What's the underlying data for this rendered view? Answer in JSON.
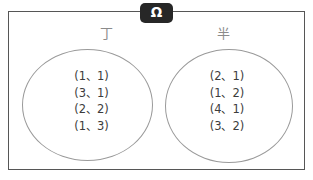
{
  "diagram": {
    "type": "venn-diagram",
    "universe": {
      "badge_label": "Ω",
      "badge_color": "#272727",
      "badge_text_color": "#ffffff",
      "border_color": "#565656"
    },
    "sets": [
      {
        "id": "left",
        "label": "丁",
        "label_color": "#8b8b8b",
        "outline_color": "#9a9a9a",
        "members": [
          "(1、1)",
          "(3、1)",
          "(2、2)",
          "(1、3)"
        ]
      },
      {
        "id": "right",
        "label": "半",
        "label_color": "#8b8b8b",
        "outline_color": "#9a9a9a",
        "members": [
          "(2、1)",
          "(1、2)",
          "(4、1)",
          "(3、2)"
        ]
      }
    ],
    "text_color": "#3c3c3c",
    "background_color": "#ffffff"
  }
}
